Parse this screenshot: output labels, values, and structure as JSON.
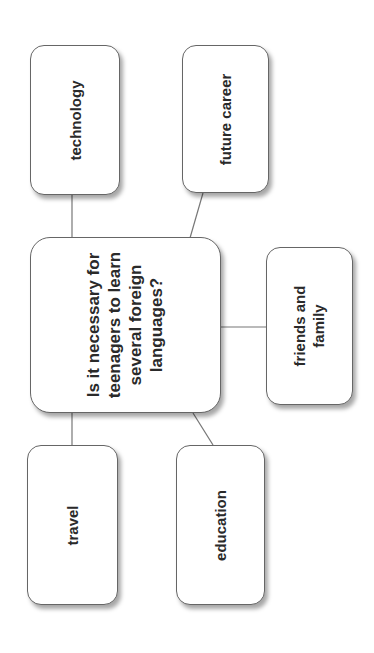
{
  "central": {
    "lines": [
      "Is it necessary for",
      "teenagers to learn",
      "several foreign",
      "languages?"
    ]
  },
  "nodes": {
    "technology": [
      "technology"
    ],
    "future_career": [
      "future career"
    ],
    "friends_family": [
      "friends and",
      "family"
    ],
    "travel": [
      "travel"
    ],
    "education": [
      "education"
    ]
  },
  "colors": {
    "border": "#666666",
    "text": "#2a2a2a",
    "connector": "#777777"
  }
}
